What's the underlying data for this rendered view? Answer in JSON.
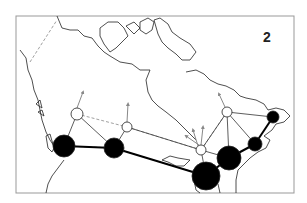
{
  "figure": {
    "panel_label": "2",
    "frame": {
      "x": 16,
      "y": 16,
      "w": 278,
      "h": 177,
      "stroke": "#999999"
    },
    "colors": {
      "coast": "#222222",
      "border": "#888888",
      "node_fill_major": "#000000",
      "node_fill_minor": "#ffffff",
      "edge_strong": "#000000",
      "edge_weak": "#333333",
      "edge_dashed": "#888888",
      "arrow": "#888888"
    },
    "nodes": [
      {
        "id": "west-coast",
        "x": 64,
        "y": 146,
        "r": 11,
        "type": "major"
      },
      {
        "id": "prairie-west",
        "x": 114,
        "y": 148,
        "r": 10,
        "type": "major"
      },
      {
        "id": "great-lakes-south",
        "x": 206,
        "y": 176,
        "r": 14,
        "type": "major"
      },
      {
        "id": "st-lawrence",
        "x": 229,
        "y": 158,
        "r": 12,
        "type": "major"
      },
      {
        "id": "east-mid",
        "x": 255,
        "y": 144,
        "r": 7,
        "type": "major"
      },
      {
        "id": "east-north",
        "x": 273,
        "y": 117,
        "r": 6,
        "type": "major"
      },
      {
        "id": "north-west",
        "x": 77,
        "y": 114,
        "r": 6,
        "type": "minor"
      },
      {
        "id": "north-prairie",
        "x": 127,
        "y": 127,
        "r": 5,
        "type": "minor"
      },
      {
        "id": "north-lakes",
        "x": 201,
        "y": 150,
        "r": 5,
        "type": "minor"
      },
      {
        "id": "north-east",
        "x": 227,
        "y": 112,
        "r": 5,
        "type": "minor"
      }
    ],
    "edges_strong": [
      [
        64,
        146,
        114,
        148
      ],
      [
        114,
        148,
        206,
        176
      ],
      [
        206,
        176,
        229,
        158
      ],
      [
        229,
        158,
        255,
        144
      ],
      [
        255,
        144,
        273,
        117
      ]
    ],
    "edges_thin": [
      [
        77,
        114,
        64,
        146
      ],
      [
        77,
        114,
        114,
        148
      ],
      [
        127,
        127,
        114,
        148
      ],
      [
        127,
        127,
        201,
        150
      ],
      [
        201,
        150,
        206,
        176
      ],
      [
        201,
        150,
        229,
        158
      ],
      [
        227,
        112,
        229,
        158
      ],
      [
        227,
        112,
        201,
        150
      ],
      [
        227,
        112,
        273,
        117
      ],
      [
        227,
        112,
        255,
        144
      ]
    ],
    "edges_dashed": [
      [
        77,
        114,
        127,
        127
      ],
      [
        64,
        146,
        114,
        148
      ],
      [
        114,
        148,
        206,
        176
      ],
      [
        127,
        127,
        201,
        150
      ],
      [
        201,
        150,
        227,
        112
      ],
      [
        30,
        62,
        57,
        20
      ]
    ],
    "arrows": [
      [
        77,
        108,
        83,
        92
      ],
      [
        127,
        122,
        128,
        104
      ],
      [
        199,
        145,
        186,
        136
      ],
      [
        201,
        145,
        203,
        127
      ],
      [
        198,
        146,
        193,
        130
      ],
      [
        225,
        107,
        219,
        94
      ]
    ]
  }
}
